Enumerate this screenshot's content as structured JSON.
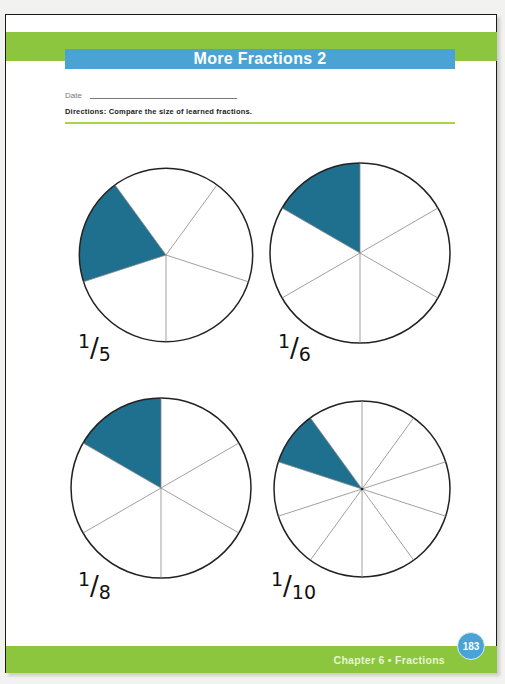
{
  "header": {
    "title": "More Fractions  2",
    "date_label": "Date",
    "directions": "Directions:  Compare the size of learned fractions."
  },
  "colors": {
    "band_green": "#8cc63f",
    "title_blue": "#4aa3d4",
    "shade_teal": "#1f6f8f"
  },
  "pies": [
    {
      "label_num": "1",
      "label_den": "5",
      "slices": 5,
      "shaded": 1
    },
    {
      "label_num": "1",
      "label_den": "6",
      "slices": 6,
      "shaded": 1
    },
    {
      "label_num": "1",
      "label_den": "8",
      "slices": 6,
      "shaded": 1
    },
    {
      "label_num": "1",
      "label_den": "10",
      "slices": 10,
      "shaded": 1
    }
  ],
  "footer": {
    "chapter": "Chapter 6  •  Fractions",
    "page_number": "183"
  }
}
